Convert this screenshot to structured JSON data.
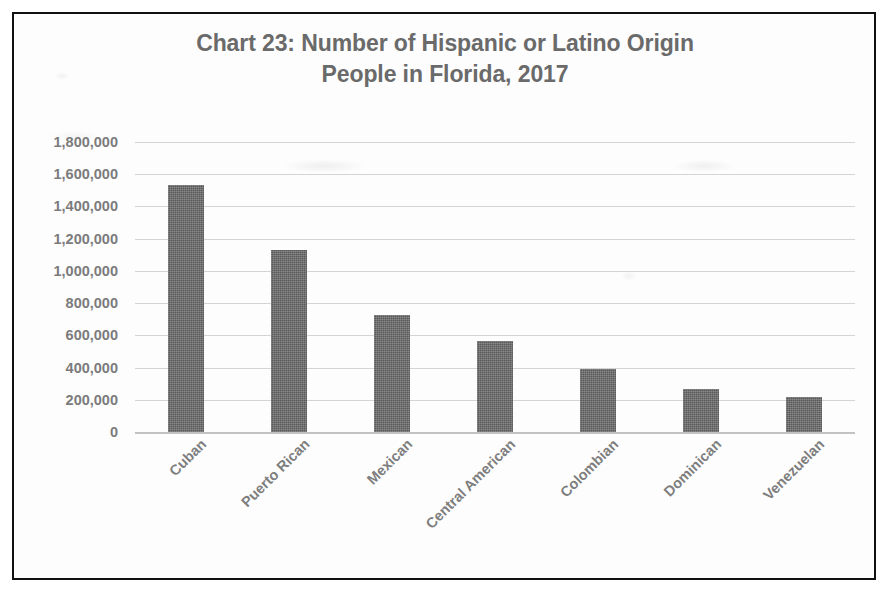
{
  "figure": {
    "border_color": "#101010",
    "background_color": "#fdfdfd"
  },
  "title": {
    "line1": "Chart 23: Number of Hispanic or Latino Origin",
    "line2": "People in Florida, 2017",
    "color": "#6a6a6a"
  },
  "chart_data": {
    "type": "bar",
    "title": "Chart 23: Number of Hispanic or Latino Origin People in Florida, 2017",
    "xlabel": "",
    "ylabel": "",
    "categories": [
      "Cuban",
      "Puerto Rican",
      "Mexican",
      "Central American",
      "Colombian",
      "Dominican",
      "Venezuelan"
    ],
    "values": [
      1535000,
      1130000,
      725000,
      565000,
      390000,
      265000,
      220000
    ],
    "ylim": [
      0,
      1800000
    ],
    "ytick_values": [
      0,
      200000,
      400000,
      600000,
      800000,
      1000000,
      1200000,
      1400000,
      1600000,
      1800000
    ],
    "ytick_labels": [
      "0",
      "200,000",
      "400,000",
      "600,000",
      "800,000",
      "1,000,000",
      "1,200,000",
      "1,400,000",
      "1,600,000",
      "1,800,000"
    ],
    "grid": true,
    "legend": false,
    "bar_color": "#595959",
    "gridline_color": "#d4d4d4",
    "tick_label_rotation": -45
  }
}
